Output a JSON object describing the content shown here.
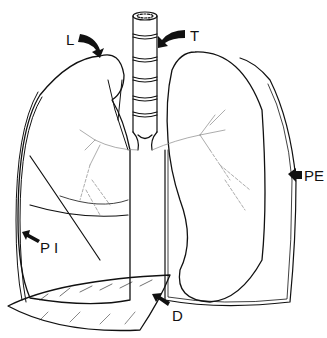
{
  "diagram": {
    "labels": [
      {
        "id": "L",
        "text": "L",
        "x": 66,
        "y": 32
      },
      {
        "id": "T",
        "text": "T",
        "x": 190,
        "y": 28
      },
      {
        "id": "PE",
        "text": "PE",
        "x": 296,
        "y": 168
      },
      {
        "id": "PI",
        "text": "P I",
        "x": 40,
        "y": 240
      },
      {
        "id": "D",
        "text": "D",
        "x": 172,
        "y": 308
      }
    ],
    "colors": {
      "ink": "#111111",
      "background": "#ffffff",
      "faint": "#888888"
    }
  }
}
